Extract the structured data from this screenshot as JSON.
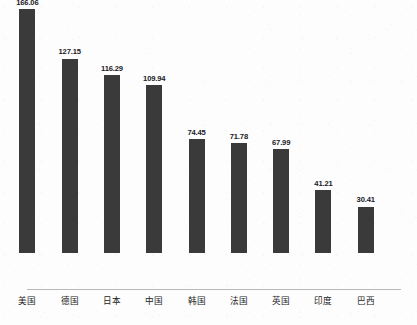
{
  "chart_data": {
    "type": "bar",
    "title": "",
    "subtitle": "",
    "xlabel": "",
    "ylabel": "",
    "categories": [
      "美国",
      "德国",
      "日本",
      "中国",
      "韩国",
      "法国",
      "英国",
      "印度",
      "巴西"
    ],
    "values": [
      166.06,
      127.15,
      116.29,
      109.94,
      74.45,
      71.78,
      67.99,
      41.21,
      30.41
    ],
    "value_labels": [
      "166.06",
      "127.15",
      "116.29",
      "109.94",
      "74.45",
      "71.78",
      "67.99",
      "41.21",
      "30.41"
    ],
    "ylim": [
      0,
      166.06
    ],
    "grid": false,
    "legend": false,
    "y_axis_visible": false,
    "x_axis_visible": true,
    "data_labels_position": "above-bar",
    "bar_color": "#3a3a3a",
    "axis_color": "#b9b9b9",
    "background_color": "#fdfdfd",
    "label_color": "#20201f",
    "series": [
      {
        "name": "",
        "values": [
          166.06,
          127.15,
          116.29,
          109.94,
          74.45,
          71.78,
          67.99,
          41.21,
          30.41
        ]
      }
    ]
  }
}
